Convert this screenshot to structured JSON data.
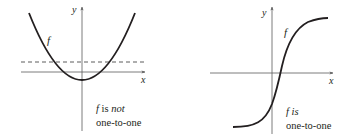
{
  "figures": [
    {
      "id": "left",
      "function_label": "f",
      "axis_x_label": "x",
      "axis_y_label": "y",
      "caption_line1_italic_f": "f",
      "caption_line1_is": " is ",
      "caption_line1_emph": "not",
      "caption_line2": "one-to-one",
      "curve_type": "parabola",
      "has_horizontal_test_line": true
    },
    {
      "id": "right",
      "function_label": "f",
      "axis_x_label": "x",
      "axis_y_label": "y",
      "caption_line1_italic": "f is",
      "caption_line2": "one-to-one",
      "curve_type": "sigmoid",
      "has_horizontal_test_line": false
    }
  ],
  "colors": {
    "curve": "#231f20",
    "axis": "#5a5a5a",
    "text": "#231f20",
    "background": "#ffffff"
  }
}
